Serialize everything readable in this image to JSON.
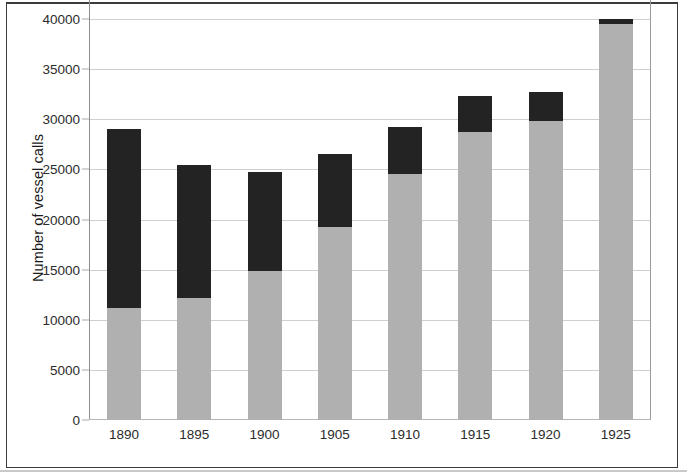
{
  "chart_data": {
    "type": "bar",
    "subtype": "stacked-bar",
    "title": "",
    "xlabel": "",
    "ylabel": "Number of vessel calls",
    "categories": [
      "1890",
      "1895",
      "1900",
      "1905",
      "1910",
      "1915",
      "1920",
      "1925"
    ],
    "series": [
      {
        "name": "lower-segment",
        "color": "#b0b0b0",
        "values": [
          11200,
          12200,
          14900,
          19300,
          24500,
          28700,
          29800,
          39500
        ]
      },
      {
        "name": "upper-segment",
        "color": "#232323",
        "values": [
          17800,
          13200,
          9800,
          7200,
          4700,
          3600,
          2900,
          500
        ]
      }
    ],
    "totals": [
      29000,
      25400,
      24700,
      26500,
      29200,
      32300,
      32700,
      40000
    ],
    "ylim": [
      0,
      40000
    ],
    "ytick_values": [
      0,
      5000,
      10000,
      15000,
      20000,
      25000,
      30000,
      35000,
      40000
    ],
    "ytick_labels": [
      "0",
      "5000",
      "10000",
      "15000",
      "20000",
      "25000",
      "30000",
      "35000",
      "40000"
    ],
    "grid": true,
    "grid_axis": "y",
    "legend": false,
    "legend_position": "none",
    "background_color": "#ffffff",
    "gridline_color": "#cfcfcf"
  }
}
